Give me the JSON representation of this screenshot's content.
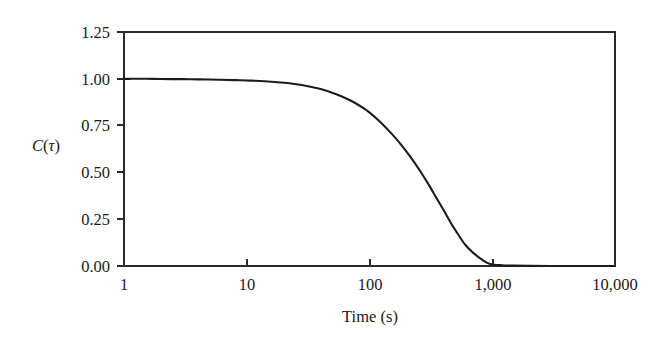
{
  "chart_data": {
    "type": "line",
    "title": "",
    "subtitle": "",
    "xlabel": "Time (s)",
    "ylabel": "C(τ)",
    "ylabel_parts": {
      "symbol": "C",
      "open": "(",
      "variable": "τ",
      "close": ")"
    },
    "xscale": "log",
    "yscale": "linear",
    "xlim": [
      1,
      10000
    ],
    "ylim": [
      0.0,
      1.25
    ],
    "grid": false,
    "legend": null,
    "legend_position": "none",
    "frame": "box",
    "xticks": [
      1,
      10,
      100,
      1000,
      10000
    ],
    "xtick_labels": [
      "1",
      "10",
      "100",
      "1,000",
      "10,000"
    ],
    "yticks": [
      0.0,
      0.25,
      0.5,
      0.75,
      1.0,
      1.25
    ],
    "ytick_labels": [
      "0.00",
      "0.25",
      "0.50",
      "0.75",
      "1.00",
      "1.25"
    ],
    "series": [
      {
        "name": "autocorrelation",
        "color": "#1c1c1c",
        "linewidth": 2.1,
        "x": [
          1,
          1.5,
          2,
          3,
          4,
          6,
          8,
          10,
          14,
          20,
          28,
          40,
          55,
          70,
          90,
          100,
          120,
          150,
          180,
          220,
          260,
          300,
          350,
          400,
          460,
          520,
          600,
          700,
          800,
          900,
          1000,
          1200,
          1500,
          2000,
          3000,
          5000,
          7000,
          10000
        ],
        "y": [
          1.0,
          1.0,
          0.999,
          0.998,
          0.997,
          0.995,
          0.993,
          0.991,
          0.987,
          0.979,
          0.967,
          0.945,
          0.915,
          0.884,
          0.842,
          0.82,
          0.775,
          0.71,
          0.65,
          0.575,
          0.505,
          0.44,
          0.365,
          0.3,
          0.23,
          0.175,
          0.115,
          0.07,
          0.04,
          0.018,
          0.008,
          0.004,
          0.002,
          0.001,
          0.0,
          0.0,
          0.0,
          0.0
        ]
      }
    ],
    "annotations": []
  },
  "axis": {
    "x_title": "Time (s)",
    "y_title_symbol": "C",
    "y_title_open": "(",
    "y_title_tau": "τ",
    "y_title_close": ")"
  },
  "x_tick_labels": [
    "1",
    "10",
    "100",
    "1,000",
    "10,000"
  ],
  "y_tick_labels": [
    "0.00",
    "0.25",
    "0.50",
    "0.75",
    "1.00",
    "1.25"
  ],
  "colors": {
    "curve": "#1c1c1c",
    "axis": "#2b2b2b",
    "background": "#ffffff",
    "text": "#1a1a1a"
  }
}
